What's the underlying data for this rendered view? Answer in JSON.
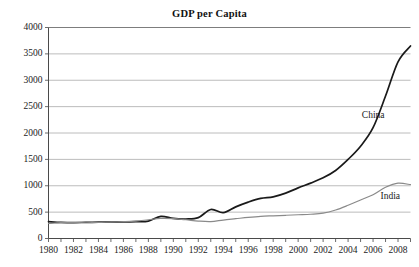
{
  "chart_data": {
    "type": "line",
    "title": "GDP per Capita",
    "xlabel": "",
    "ylabel": "",
    "xlim": [
      1980,
      2009
    ],
    "ylim": [
      0,
      4000
    ],
    "grid": true,
    "grid_axis": "y",
    "legend_position": "inline-annotation",
    "x": [
      1980,
      1981,
      1982,
      1983,
      1984,
      1985,
      1986,
      1987,
      1988,
      1989,
      1990,
      1991,
      1992,
      1993,
      1994,
      1995,
      1996,
      1997,
      1998,
      1999,
      2000,
      2001,
      2002,
      2003,
      2004,
      2005,
      2006,
      2007,
      2008,
      2009
    ],
    "xticks": [
      1980,
      1981,
      1982,
      1983,
      1984,
      1985,
      1986,
      1987,
      1988,
      1989,
      1990,
      1991,
      1992,
      1993,
      1994,
      1995,
      1996,
      1997,
      1998,
      1999,
      2000,
      2001,
      2002,
      2003,
      2004,
      2005,
      2006,
      2007,
      2008,
      2009
    ],
    "xtick_labels": [
      "1980",
      "1982",
      "1984",
      "1986",
      "1988",
      "1990",
      "1992",
      "1994",
      "1996",
      "1998",
      "2000",
      "2002",
      "2004",
      "2006",
      "2008"
    ],
    "xtick_label_values": [
      1980,
      1982,
      1984,
      1986,
      1988,
      1990,
      1992,
      1994,
      1996,
      1998,
      2000,
      2002,
      2004,
      2006,
      2008
    ],
    "yticks": [
      0,
      500,
      1000,
      1500,
      2000,
      2500,
      3000,
      3500,
      4000
    ],
    "ytick_labels": [
      "0",
      "500",
      "1000",
      "1500",
      "2000",
      "2500",
      "3000",
      "3500",
      "4000"
    ],
    "series": [
      {
        "name": "China",
        "color": "#1a1a1a",
        "width": 1.7,
        "label_x": 2005.1,
        "label_y": 2330,
        "values": [
          320,
          305,
          300,
          305,
          310,
          315,
          315,
          320,
          330,
          420,
          380,
          370,
          395,
          550,
          490,
          600,
          690,
          760,
          790,
          860,
          960,
          1050,
          1150,
          1290,
          1500,
          1750,
          2100,
          2700,
          3350,
          3650
        ]
      },
      {
        "name": "India",
        "color": "#8a8a8a",
        "width": 1.2,
        "label_x": 2006.6,
        "label_y": 790,
        "values": [
          285,
          300,
          300,
          310,
          305,
          315,
          320,
          330,
          355,
          380,
          375,
          355,
          330,
          320,
          350,
          375,
          400,
          420,
          430,
          440,
          450,
          460,
          480,
          540,
          630,
          730,
          830,
          970,
          1050,
          1020
        ]
      }
    ]
  },
  "annotations": {
    "china_label": "China",
    "india_label": "India"
  }
}
